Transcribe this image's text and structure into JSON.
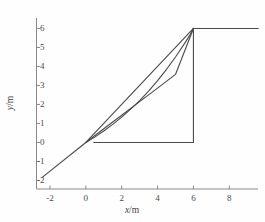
{
  "figure": {
    "background_color": "#fefefe",
    "line_color": "#4a4a4a",
    "axis_color": "#8a8a8a",
    "text_color": "#4a4a4a"
  },
  "axes": {
    "x": {
      "label_var": "x",
      "label_unit": "m",
      "label_sep": "/",
      "ticks": [
        -2,
        0,
        2,
        4,
        6,
        8
      ],
      "tick_labels": [
        "-2",
        "0",
        "2",
        "4",
        "6",
        "8"
      ],
      "range": [
        -2.75,
        9.6
      ]
    },
    "y": {
      "label_var": "y",
      "label_unit": "m",
      "label_sep": "/",
      "ticks": [
        -2,
        -1,
        0,
        1,
        2,
        3,
        4,
        5,
        6
      ],
      "tick_labels": [
        "-2",
        "-1",
        "0",
        "1",
        "2",
        "3",
        "4",
        "5",
        "6"
      ],
      "range": [
        -2.45,
        6.55
      ]
    }
  },
  "chart_data": {
    "type": "line",
    "title": "",
    "xlabel": "x/m",
    "ylabel": "y/m",
    "xlim": [
      -2.75,
      9.6
    ],
    "ylim": [
      -2.45,
      6.55
    ],
    "xticks": [
      -2,
      0,
      2,
      4,
      6,
      8
    ],
    "yticks": [
      -2,
      -1,
      0,
      1,
      2,
      3,
      4,
      5,
      6
    ],
    "grid": false,
    "legend": "none",
    "series": [
      {
        "name": "straight-ramp",
        "type": "line",
        "x": [
          -2.45,
          0.0,
          1.0,
          2.0,
          3.0,
          4.0,
          5.0,
          6.0,
          6.0,
          8.0,
          9.6
        ],
        "y": [
          -1.85,
          0.0,
          0.72,
          1.43,
          2.15,
          2.86,
          3.58,
          6.0,
          6.0,
          6.0,
          6.0
        ]
      },
      {
        "name": "upper-chord",
        "type": "line",
        "x": [
          0.0,
          1.0,
          2.0,
          3.0,
          4.0,
          5.0,
          6.0
        ],
        "y": [
          0.0,
          1.0,
          2.0,
          3.0,
          4.0,
          5.0,
          6.0
        ]
      },
      {
        "name": "lower-convex-curve",
        "type": "line",
        "x": [
          0.0,
          0.5,
          1.0,
          1.5,
          2.0,
          2.5,
          3.0,
          3.5,
          4.0,
          4.5,
          5.0,
          5.5,
          5.8,
          6.0
        ],
        "y": [
          0.0,
          0.28,
          0.6,
          0.95,
          1.33,
          1.75,
          2.2,
          2.7,
          3.25,
          3.85,
          4.5,
          5.2,
          5.65,
          6.0
        ]
      },
      {
        "name": "baseline-segment",
        "type": "line",
        "x": [
          0.45,
          2.0,
          4.0,
          6.0
        ],
        "y": [
          0.0,
          0.0,
          0.0,
          0.0
        ]
      },
      {
        "name": "vertical-drop",
        "type": "line",
        "x": [
          6.0,
          6.0
        ],
        "y": [
          0.0,
          6.0
        ]
      },
      {
        "name": "plateau",
        "type": "line",
        "x": [
          6.0,
          9.6
        ],
        "y": [
          6.0,
          6.0
        ]
      }
    ]
  }
}
